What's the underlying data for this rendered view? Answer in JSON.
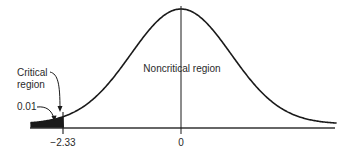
{
  "chart_data": {
    "type": "area",
    "title": "",
    "xlabel": "",
    "ylabel": "",
    "distribution": "standard normal",
    "x_ticks": [
      {
        "value": -2.33,
        "label": "−2.33"
      },
      {
        "value": 0,
        "label": "0"
      }
    ],
    "xlim": [
      -3.0,
      3.1
    ],
    "shaded_region": {
      "from": -3.0,
      "to": -2.33,
      "area": 0.01,
      "tail": "left"
    },
    "annotations": [
      {
        "text": "Critical region",
        "lines": [
          "Critical",
          "region"
        ],
        "points_to": "critical value line at -2.33"
      },
      {
        "text": "0.01",
        "points_to": "shaded left tail"
      },
      {
        "text": "Noncritical region",
        "position": "center under curve"
      }
    ],
    "grid": false,
    "legend": null
  },
  "labels": {
    "critical_line1": "Critical",
    "critical_line2": "region",
    "alpha": "0.01",
    "noncritical": "Noncritical region",
    "tick_critical": "−2.33",
    "tick_zero": "0"
  },
  "colors": {
    "curve": "#1a1a1a",
    "shade": "#1a1a1a",
    "axis": "#333333",
    "text": "#2a2a2a"
  }
}
